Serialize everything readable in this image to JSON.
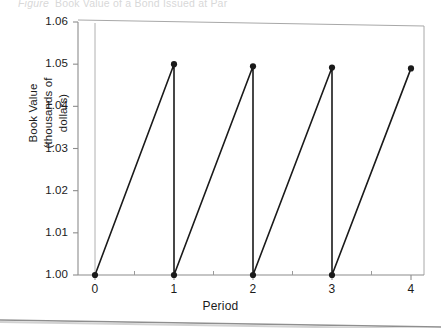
{
  "figure": {
    "caption_label": "Figure",
    "caption_text": "Book Value of a Bond Issued at Par"
  },
  "chart_data": {
    "type": "line",
    "title": "Book Value of a Bond Issued at Par",
    "xlabel": "Period",
    "ylabel": "Book Value (thousands of dollars)",
    "ylabel_line1": "Book Value",
    "ylabel_line2": "(thousands of dollars)",
    "xlim": [
      0,
      4.2
    ],
    "ylim": [
      1.0,
      1.06
    ],
    "xticks": [
      0,
      1,
      2,
      3,
      4
    ],
    "xtick_labels": [
      "0",
      "1",
      "2",
      "3",
      "4"
    ],
    "x_minor_ticks": [
      0.5,
      1.5,
      2.5,
      3.5
    ],
    "yticks": [
      1.0,
      1.01,
      1.02,
      1.03,
      1.04,
      1.05,
      1.06
    ],
    "ytick_labels": [
      "1.00",
      "1.01",
      "1.02",
      "1.03",
      "1.04",
      "1.05",
      "1.06"
    ],
    "grid": false,
    "legend": "none",
    "line_color": "#1a1a1a",
    "marker_color": "#1a1a1a",
    "axis_color": "#9a9a9a",
    "series": [
      {
        "name": "Book Value",
        "points": [
          {
            "x": 0,
            "y": 1.0,
            "marker": true
          },
          {
            "x": 1,
            "y": 1.05,
            "marker": true
          },
          {
            "x": 1,
            "y": 1.0,
            "marker": true
          },
          {
            "x": 2,
            "y": 1.0495,
            "marker": true
          },
          {
            "x": 2,
            "y": 1.0,
            "marker": true
          },
          {
            "x": 3,
            "y": 1.0492,
            "marker": true
          },
          {
            "x": 3,
            "y": 1.0,
            "marker": true
          },
          {
            "x": 4,
            "y": 1.049,
            "marker": true
          }
        ]
      }
    ],
    "annotation": "Book value accretes from 1.00 to about 1.05 within each period, then drops back to 1.00 at the coupon date."
  }
}
